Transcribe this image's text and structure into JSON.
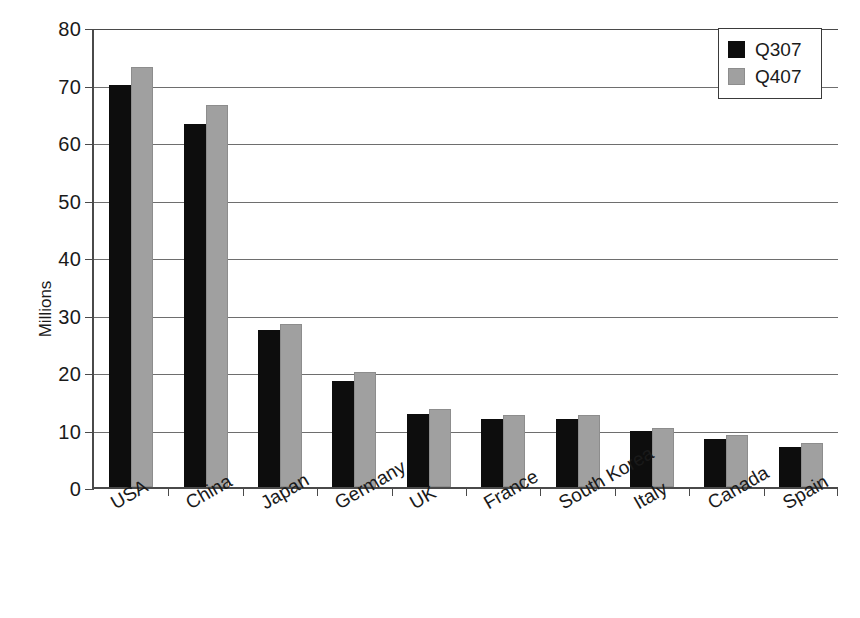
{
  "chart_data": {
    "type": "bar",
    "title": "",
    "subtitle": "",
    "xlabel": "",
    "ylabel": "Millions",
    "ylim": [
      0,
      80
    ],
    "ytick_step": 10,
    "yticks": [
      0,
      10,
      20,
      30,
      40,
      50,
      60,
      70,
      80
    ],
    "ytick_labels": [
      "0",
      "10",
      "20",
      "30",
      "40",
      "50",
      "60",
      "70",
      "80"
    ],
    "grid": true,
    "grid_axis": "y",
    "legend_position": "top-right",
    "categories": [
      "USA",
      "China",
      "Japan",
      "Germany",
      "UK",
      "France",
      "South Korea",
      "Italy",
      "Canada",
      "Spain"
    ],
    "series": [
      {
        "name": "Q307",
        "color": "#0d0d0d",
        "values": [
          70.0,
          63.2,
          27.3,
          18.5,
          12.7,
          11.9,
          11.9,
          9.8,
          8.3,
          7.0
        ]
      },
      {
        "name": "Q407",
        "color": "#a0a0a0",
        "values": [
          73.0,
          66.4,
          28.4,
          20.0,
          13.6,
          12.5,
          12.5,
          10.3,
          9.0,
          7.6
        ]
      }
    ]
  },
  "legend": {
    "entries": [
      {
        "label": "Q307",
        "swatch": "black-swatch-icon"
      },
      {
        "label": "Q407",
        "swatch": "gray-swatch-icon"
      }
    ]
  },
  "colors": {
    "series_q307": "#0d0d0d",
    "series_q407": "#a0a0a0",
    "axis": "#4a4a4a",
    "gridline": "#6e6e6e",
    "background": "#ffffff",
    "text": "#1a1a1a"
  }
}
